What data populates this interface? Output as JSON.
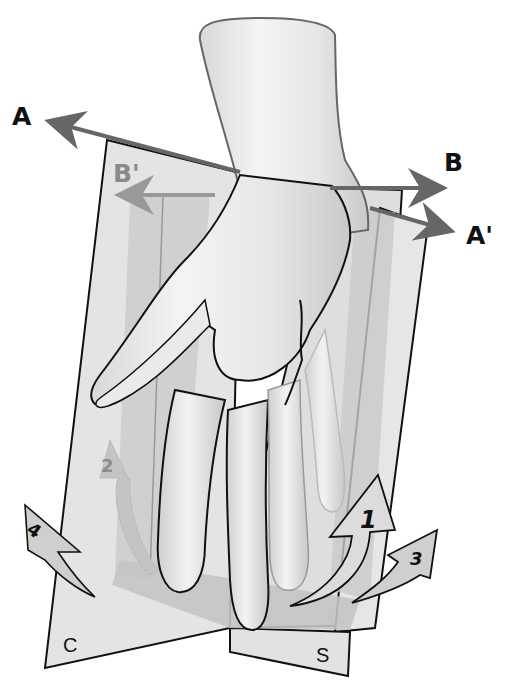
{
  "figure": {
    "colors": {
      "background": "#ffffff",
      "plane_light": "#e2e2e2",
      "plane_mid": "#cfcfcf",
      "plane_dark": "#bdbdbd",
      "skin": "#ececec",
      "axis_line": "#666666",
      "axis_line_light": "#999999",
      "outline": "#111111"
    }
  },
  "axes": [
    {
      "id": "A",
      "label": "A",
      "color": "#111111"
    },
    {
      "id": "A_prime",
      "label": "A'",
      "color": "#111111"
    },
    {
      "id": "B",
      "label": "B",
      "color": "#111111"
    },
    {
      "id": "B_prime",
      "label": "B'",
      "color": "#8a8a8a"
    }
  ],
  "planes": [
    {
      "id": "C",
      "label": "C"
    },
    {
      "id": "S",
      "label": "S"
    }
  ],
  "rotations": [
    {
      "id": "1",
      "label": "1"
    },
    {
      "id": "2",
      "label": "2"
    },
    {
      "id": "3",
      "label": "3"
    },
    {
      "id": "4",
      "label": "4"
    }
  ]
}
